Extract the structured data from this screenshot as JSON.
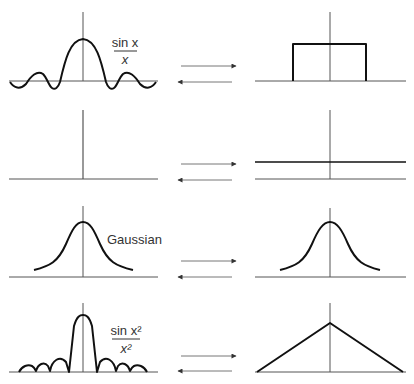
{
  "figure": {
    "rows": [
      {
        "left": {
          "name": "sinc",
          "label_num": "sin x",
          "label_den": "x"
        },
        "right": {
          "name": "rectangle"
        }
      },
      {
        "left": {
          "name": "impulse"
        },
        "right": {
          "name": "constant"
        }
      },
      {
        "left": {
          "name": "gaussian",
          "label": "Gaussian"
        },
        "right": {
          "name": "gaussian"
        }
      },
      {
        "left": {
          "name": "sinc-squared",
          "label_num": "sin x²",
          "label_den": "x²"
        },
        "right": {
          "name": "triangle"
        }
      }
    ],
    "colors": {
      "curve": "#111111",
      "axis": "#555555",
      "arrow": "#777777",
      "background": "#ffffff"
    }
  }
}
